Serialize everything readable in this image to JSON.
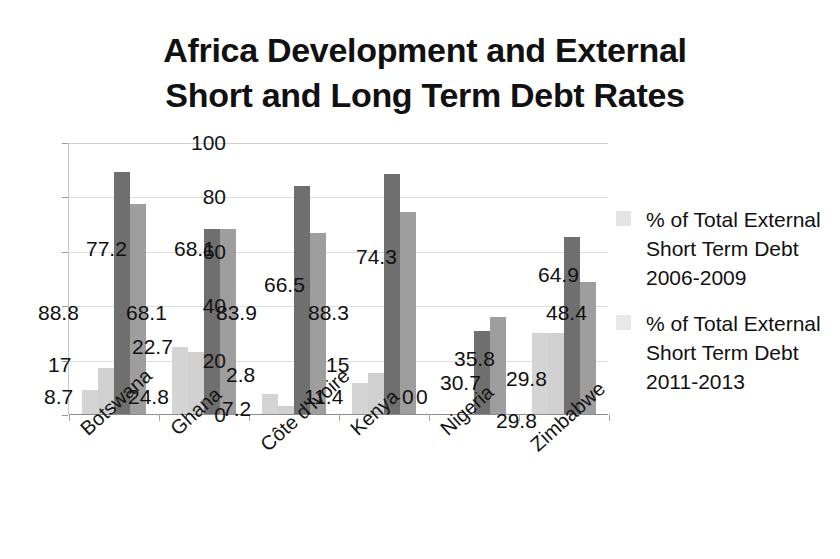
{
  "chart_data": {
    "type": "bar",
    "title": "Africa Development and External Short and Long Term Debt Rates",
    "title_lines": [
      "Africa Development and External",
      "Short and Long Term Debt Rates"
    ],
    "xlabel": "",
    "ylabel": "",
    "ylim": [
      0,
      100
    ],
    "ytick_labels": [
      "100",
      "80",
      "60",
      "40",
      "20",
      "0"
    ],
    "ytick_values": [
      100,
      80,
      60,
      40,
      20,
      0
    ],
    "grid": true,
    "legend_position": "right",
    "categories": [
      "Botswana",
      "Ghana",
      "Côte d'Ivoire",
      "Kenya",
      "Nigeria",
      "Zimbabwe"
    ],
    "series": [
      {
        "name": "% of Total External Short Term Debt 2006-2009",
        "values": [
          8.7,
          24.8,
          7.2,
          11.4,
          0,
          29.8
        ],
        "color": "#d4d4d4"
      },
      {
        "name": "% of Total External Short Term Debt 2011-2013",
        "values": [
          17,
          22.7,
          2.8,
          15,
          0,
          29.8
        ],
        "color": "#d0d0d0"
      },
      {
        "name": "Series 3",
        "values": [
          88.8,
          68.1,
          83.9,
          88.3,
          30.7,
          64.9
        ],
        "color": "#6f6f6f"
      },
      {
        "name": "Series 4",
        "values": [
          77.2,
          68.1,
          66.5,
          74.3,
          35.8,
          48.4
        ],
        "color": "#9e9e9e"
      }
    ],
    "data_labels": [
      [
        "8.7",
        "17",
        "88.8",
        "77.2"
      ],
      [
        "24.8",
        "22.7",
        "68.1",
        "68.1"
      ],
      [
        "7.2",
        "2.8",
        "83.9",
        "66.5"
      ],
      [
        "11.4",
        "15",
        "88.3",
        "74.3"
      ],
      [
        "0",
        "0",
        "30.7",
        "35.8"
      ],
      [
        "29.8",
        "29.8",
        "64.9",
        "48.4"
      ]
    ]
  },
  "legend": {
    "entries": [
      {
        "label": "% of Total External Short Term Debt 2006-2009",
        "swatch": "legend-swatch-series-1"
      },
      {
        "label": "% of Total External Short Term Debt 2011-2013",
        "swatch": "legend-swatch-series-2"
      }
    ]
  }
}
